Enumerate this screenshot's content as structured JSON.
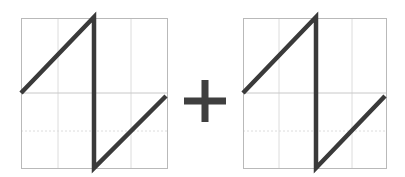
{
  "colors": {
    "background": "#ffffff",
    "frame": "#b9b9b9",
    "grid_major": "#c8c8c8",
    "grid_minor": "#dcdcdc",
    "waveform": "#3a3a3a",
    "operator": "#3f3f3f"
  },
  "panels": [
    {
      "id": "left",
      "label": "sawtooth-waveform-a",
      "frame": {
        "x": 21,
        "y": 18,
        "w": 146,
        "h": 150
      },
      "grid_vertical": [
        58,
        94,
        131
      ],
      "grid_horizontal_major": [
        93
      ],
      "grid_horizontal_minor": [
        131
      ],
      "polyline": [
        [
          21,
          93
        ],
        [
          94,
          17
        ],
        [
          94,
          168
        ],
        [
          166,
          96
        ]
      ]
    },
    {
      "id": "right",
      "label": "sawtooth-waveform-b",
      "frame": {
        "x": 243,
        "y": 18,
        "w": 143,
        "h": 150
      },
      "grid_vertical": [
        279,
        316,
        352
      ],
      "grid_horizontal_major": [
        93
      ],
      "grid_horizontal_minor": [
        131
      ],
      "polyline": [
        [
          243,
          93
        ],
        [
          316,
          17
        ],
        [
          316,
          168
        ],
        [
          385,
          96
        ]
      ]
    }
  ],
  "operator": {
    "symbol": "+",
    "cx": 205,
    "cy": 101,
    "arm": 21,
    "thickness": 7
  }
}
